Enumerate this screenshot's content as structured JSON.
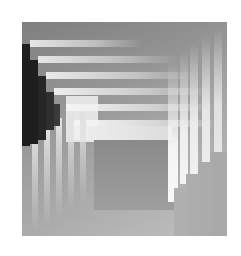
{
  "artwork": {
    "description": "Abstract grayscale composition of nested L-shaped light bars with a dark stepped region at upper-left",
    "colors": {
      "background": "#ffffff",
      "base_dark": "#8a8a8a",
      "base_light": "#b8b8b8",
      "bar_light": "#f2f2f2",
      "shadow": "#1e1e1e",
      "lower_right_block": "#a8a8a8"
    },
    "hbars": [
      {
        "x": 8,
        "y": 18,
        "w": 112
      },
      {
        "x": 16,
        "y": 34,
        "w": 130
      },
      {
        "x": 24,
        "y": 50,
        "w": 140
      },
      {
        "x": 32,
        "y": 66,
        "w": 150
      },
      {
        "x": 40,
        "y": 82,
        "w": 150
      },
      {
        "x": 50,
        "y": 98,
        "w": 140
      }
    ],
    "vbars": [
      {
        "x": 150,
        "y": 40,
        "h": 140
      },
      {
        "x": 162,
        "y": 32,
        "h": 136
      },
      {
        "x": 174,
        "y": 24,
        "h": 128
      },
      {
        "x": 186,
        "y": 16,
        "h": 120
      },
      {
        "x": 198,
        "y": 8,
        "h": 110
      },
      {
        "x": 12,
        "y": 100,
        "h": 110
      },
      {
        "x": 24,
        "y": 100,
        "h": 100
      },
      {
        "x": 36,
        "y": 96,
        "h": 100
      },
      {
        "x": 48,
        "y": 92,
        "h": 96
      },
      {
        "x": 60,
        "y": 88,
        "h": 90
      }
    ],
    "dark_steps": [
      {
        "x": 0,
        "y": 22,
        "w": 8,
        "h": 102
      },
      {
        "x": 8,
        "y": 38,
        "w": 8,
        "h": 86
      },
      {
        "x": 16,
        "y": 54,
        "w": 8,
        "h": 62
      },
      {
        "x": 24,
        "y": 70,
        "w": 8,
        "h": 46
      },
      {
        "x": 0,
        "y": 102,
        "w": 14,
        "h": 22
      }
    ]
  }
}
